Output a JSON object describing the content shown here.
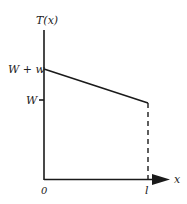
{
  "diagram": {
    "y_axis_label": "T(x)",
    "x_axis_label": "x",
    "y_ticks": [
      {
        "label": "W + w",
        "y": 69
      },
      {
        "label": "W",
        "y": 100
      }
    ],
    "x_ticks": [
      {
        "label": "0",
        "x": 44
      },
      {
        "label": "l",
        "x": 148
      }
    ],
    "line": {
      "from": [
        0,
        "W + w"
      ],
      "to": [
        "l",
        "W"
      ]
    },
    "colors": {
      "stroke": "#1a1a1a",
      "background": "#ffffff"
    }
  }
}
